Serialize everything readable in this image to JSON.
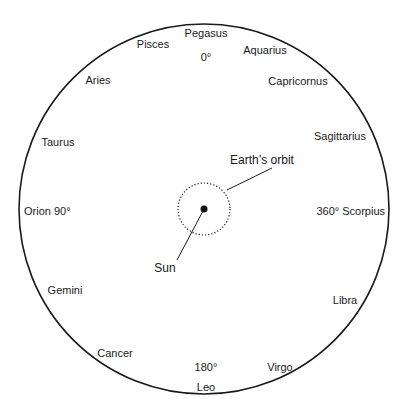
{
  "diagram": {
    "colors": {
      "line": "#1a1a1a",
      "background": "#ffffff"
    },
    "outer_circle": {
      "cx": 204,
      "cy": 209,
      "r": 185
    },
    "orbit": {
      "cx": 204,
      "cy": 209,
      "r": 26,
      "style": "dotted"
    },
    "sun_dot": {
      "cx": 204,
      "cy": 209,
      "r": 3.5
    },
    "constellations": [
      {
        "name": "Pegasus",
        "x": 206,
        "y": 37,
        "anchor": "middle"
      },
      {
        "name": "Pisces",
        "x": 153,
        "y": 48,
        "anchor": "middle"
      },
      {
        "name": "Aquarius",
        "x": 265,
        "y": 54,
        "anchor": "middle"
      },
      {
        "name": "Aries",
        "x": 98,
        "y": 84,
        "anchor": "middle"
      },
      {
        "name": "Capricornus",
        "x": 298,
        "y": 85,
        "anchor": "middle"
      },
      {
        "name": "Sagittarius",
        "x": 340,
        "y": 140,
        "anchor": "middle"
      },
      {
        "name": "Taurus",
        "x": 58,
        "y": 146,
        "anchor": "middle"
      },
      {
        "name": "Orion 90°",
        "x": 24,
        "y": 215,
        "anchor": "start"
      },
      {
        "name": "360° Scorpius",
        "x": 385,
        "y": 215,
        "anchor": "end"
      },
      {
        "name": "Gemini",
        "x": 65,
        "y": 294,
        "anchor": "middle"
      },
      {
        "name": "Libra",
        "x": 345,
        "y": 304,
        "anchor": "middle"
      },
      {
        "name": "Cancer",
        "x": 115,
        "y": 357,
        "anchor": "middle"
      },
      {
        "name": "Virgo",
        "x": 280,
        "y": 371,
        "anchor": "middle"
      },
      {
        "name": "Leo",
        "x": 206,
        "y": 391,
        "anchor": "middle"
      }
    ],
    "degree_marks": [
      {
        "label": "0°",
        "x": 206,
        "y": 61
      },
      {
        "label": "180°",
        "x": 206,
        "y": 371
      }
    ],
    "callouts": {
      "earth_orbit": {
        "label": "Earth’s orbit",
        "text_x": 262,
        "text_y": 164,
        "x1": 227,
        "y1": 190,
        "x2": 272,
        "y2": 168
      },
      "sun": {
        "label": "Sun",
        "text_x": 165,
        "text_y": 272,
        "x1": 203,
        "y1": 211,
        "x2": 177,
        "y2": 260
      }
    }
  }
}
